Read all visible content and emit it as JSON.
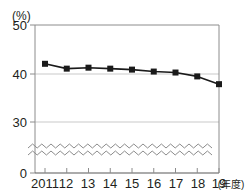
{
  "chart_data": {
    "type": "line",
    "title": "",
    "xlabel": "(年度)",
    "ylabel": "",
    "yunit": "(%)",
    "categories": [
      "2011",
      "12",
      "13",
      "14",
      "15",
      "16",
      "17",
      "18",
      "19"
    ],
    "values": [
      42.0,
      41.0,
      41.2,
      41.0,
      40.8,
      40.4,
      40.2,
      39.4,
      37.8
    ],
    "ylim": [
      0,
      50
    ],
    "yticks": [
      "0",
      "30",
      "40",
      "50"
    ],
    "ytick_values": [
      0,
      30,
      40,
      50
    ],
    "gridlines": [
      30,
      40
    ],
    "grid": true,
    "legend": "none",
    "axis_break": true,
    "axis_break_style": "zigzag",
    "marker": "filled-square",
    "series_color": "#1a1a1a",
    "grid_color": "#c9c9c9",
    "axis_color": "#8c8c8c"
  },
  "axis": {
    "unit_label": "(%)",
    "x_caption": "(年度)",
    "y_tick_0": "0",
    "y_tick_30": "30",
    "y_tick_40": "40",
    "y_tick_50": "50",
    "x_tick_0": "2011",
    "x_tick_1": "12",
    "x_tick_2": "13",
    "x_tick_3": "14",
    "x_tick_4": "15",
    "x_tick_5": "16",
    "x_tick_6": "17",
    "x_tick_7": "18",
    "x_tick_8": "19"
  }
}
